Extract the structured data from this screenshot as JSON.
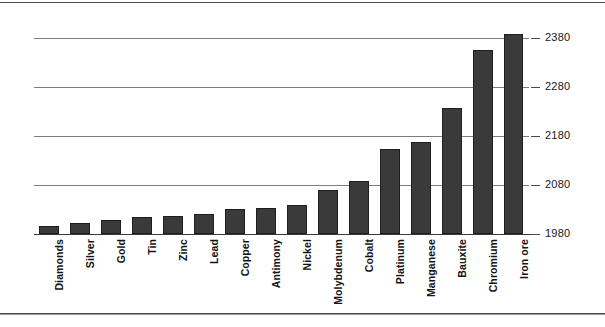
{
  "chart_data": {
    "type": "bar",
    "title": "",
    "subtitle": "",
    "xlabel": "",
    "ylabel": "",
    "orientation": "vertical",
    "grid": true,
    "grid_axis": "y",
    "legend": "none",
    "ylim": [
      1980,
      2400
    ],
    "yticks": [
      1980,
      2080,
      2180,
      2280,
      2380
    ],
    "ytick_labels": [
      "1980",
      "2080",
      "2180",
      "2280",
      "2380"
    ],
    "categories": [
      "Diamonds",
      "Silver",
      "Gold",
      "Tin",
      "Zinc",
      "Lead",
      "Copper",
      "Antimony",
      "Nickel",
      "Molybdenum",
      "Cobalt",
      "Platinum",
      "Manganese",
      "Bauxite",
      "Chromium",
      "Iron ore"
    ],
    "values": [
      1997,
      2002,
      2008,
      2014,
      2016,
      2020,
      2032,
      2034,
      2040,
      2069,
      2089,
      2153,
      2167,
      2238,
      2355,
      2388
    ],
    "bar_color": "#3a3a3a",
    "grid_color": "#7d7d7d",
    "axis_color": "#3a3a3a"
  },
  "figure": {
    "background": "#ffffff",
    "has_top_rule": true,
    "has_bottom_rule": true
  }
}
